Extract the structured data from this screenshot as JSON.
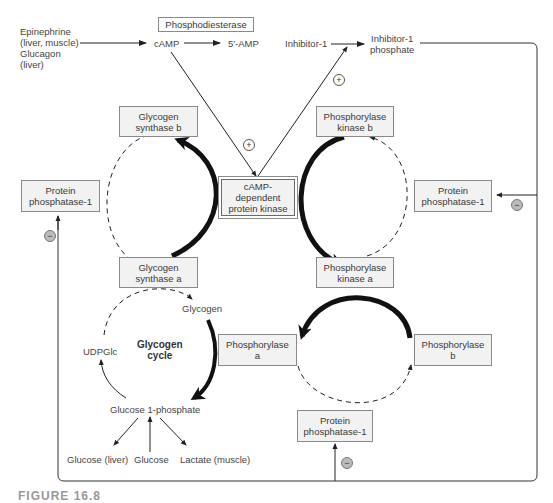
{
  "diagram": {
    "hormones": {
      "line1": "Epinephrine",
      "line2": "(liver, muscle)",
      "line3": "Glucagon",
      "line4": "(liver)"
    },
    "camp": "cAMP",
    "amp": "5′-AMP",
    "phosphodiesterase": "Phosphodiesterase",
    "inhibitor1": "Inhibitor-1",
    "inhibitor1_phosphate": {
      "line1": "Inhibitor-1",
      "line2": "phosphate"
    },
    "pka": {
      "line1": "cAMP-",
      "line2": "dependent",
      "line3": "protein kinase"
    },
    "glycogen_synthase_b": {
      "line1": "Glycogen",
      "line2": "synthase b"
    },
    "glycogen_synthase_a": {
      "line1": "Glycogen",
      "line2": "synthase a"
    },
    "phosphorylase_kinase_b": {
      "line1": "Phosphorylase",
      "line2": "kinase b"
    },
    "phosphorylase_kinase_a": {
      "line1": "Phosphorylase",
      "line2": "kinase a"
    },
    "phosphorylase_a": {
      "line1": "Phosphorylase",
      "line2": "a"
    },
    "phosphorylase_b": {
      "line1": "Phosphorylase",
      "line2": "b"
    },
    "pp1_left": {
      "line1": "Protein",
      "line2": "phosphatase-1"
    },
    "pp1_right": {
      "line1": "Protein",
      "line2": "phosphatase-1"
    },
    "pp1_bottom": {
      "line1": "Protein",
      "line2": "phosphatase-1"
    },
    "glycogen": "Glycogen",
    "udpglc": "UDPGlc",
    "cycle_label": {
      "line1": "Glycogen",
      "line2": "cycle"
    },
    "glucose_1_phosphate": "Glucose 1-phosphate",
    "glucose_liver": "Glucose (liver)",
    "glucose": "Glucose",
    "lactate": "Lactate (muscle)",
    "plus_sign": "+",
    "minus_sign": "−",
    "caption": "FIGURE 16.8"
  }
}
